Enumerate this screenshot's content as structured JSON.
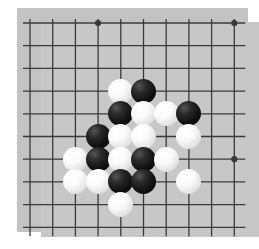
{
  "app": {
    "title": "Go Board Position",
    "image_kind": "go-goban-photo"
  },
  "board": {
    "type": "go-board",
    "visible_columns": 10,
    "visible_rows": 10,
    "grid_origin_x": 30,
    "grid_origin_y": 23,
    "grid_spacing": 22.7,
    "board_color": "#c3c3c3",
    "board_inner_color": "#c7c7c7",
    "line_color": "#3a3a3a",
    "page_background": "#ffffff",
    "black_stone_color": "#101010",
    "white_stone_color": "#f2f2f2",
    "stone_diameter": 25,
    "star_points": [
      {
        "name": "star-point-top-left",
        "col": 3,
        "row": 0
      },
      {
        "name": "star-point-top-right",
        "col": 9,
        "row": 0
      },
      {
        "name": "star-point-right",
        "col": 9,
        "row": 6
      }
    ],
    "stones": [
      {
        "id": "w1",
        "color": "white",
        "col": 4,
        "row": 3
      },
      {
        "id": "b1",
        "color": "black",
        "col": 5,
        "row": 3
      },
      {
        "id": "b2",
        "color": "black",
        "col": 4,
        "row": 4
      },
      {
        "id": "w2",
        "color": "white",
        "col": 5,
        "row": 4
      },
      {
        "id": "w3",
        "color": "white",
        "col": 6,
        "row": 4
      },
      {
        "id": "b3",
        "color": "black",
        "col": 7,
        "row": 4
      },
      {
        "id": "b4",
        "color": "black",
        "col": 3,
        "row": 5
      },
      {
        "id": "w4",
        "color": "white",
        "col": 4,
        "row": 5
      },
      {
        "id": "w5",
        "color": "white",
        "col": 5,
        "row": 5
      },
      {
        "id": "w6",
        "color": "white",
        "col": 7,
        "row": 5
      },
      {
        "id": "w7",
        "color": "white",
        "col": 2,
        "row": 6
      },
      {
        "id": "b5",
        "color": "black",
        "col": 3,
        "row": 6
      },
      {
        "id": "w8",
        "color": "white",
        "col": 4,
        "row": 6
      },
      {
        "id": "b6",
        "color": "black",
        "col": 5,
        "row": 6
      },
      {
        "id": "w9",
        "color": "white",
        "col": 6,
        "row": 6
      },
      {
        "id": "w10",
        "color": "white",
        "col": 2,
        "row": 7
      },
      {
        "id": "w11",
        "color": "white",
        "col": 3,
        "row": 7
      },
      {
        "id": "b7",
        "color": "black",
        "col": 4,
        "row": 7
      },
      {
        "id": "b8",
        "color": "black",
        "col": 5,
        "row": 7
      },
      {
        "id": "w12",
        "color": "white",
        "col": 7,
        "row": 7
      },
      {
        "id": "w13",
        "color": "white",
        "col": 4,
        "row": 8
      }
    ],
    "counts": {
      "black_stones": 8,
      "white_stones": 13,
      "total_stones": 21
    }
  }
}
